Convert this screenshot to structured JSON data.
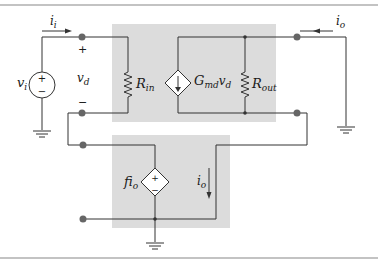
{
  "diagram": {
    "type": "circuit",
    "colors": {
      "wire": "#333333",
      "box": "#dcdcdc",
      "node": "#666666",
      "border": "#888888"
    },
    "labels": {
      "input_current": "i",
      "input_current_sub": "i",
      "output_current": "i",
      "output_current_sub": "o",
      "source_v": "v",
      "source_v_sub": "i",
      "vd": "v",
      "vd_sub": "d",
      "vd_plus": "+",
      "vd_minus": "−",
      "rin": "R",
      "rin_sub": "in",
      "gm": "G",
      "gm_sub": "md",
      "gm_v": "v",
      "gm_v_sub": "d",
      "rout": "R",
      "rout_sub": "out",
      "fb": "fi",
      "fb_sub": "o",
      "fb_current": "i",
      "fb_current_sub": "o",
      "src_plus": "+",
      "src_minus": "−",
      "dep_plus": "+",
      "dep_minus": "−"
    }
  }
}
